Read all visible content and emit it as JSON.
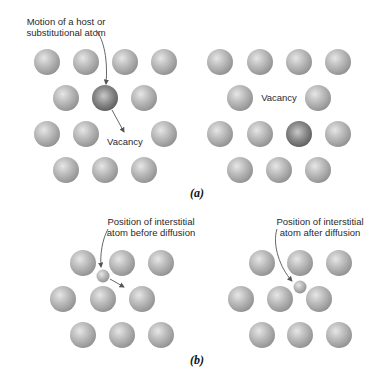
{
  "figure": {
    "panel_a": {
      "tag": "(a)",
      "left": {
        "label_line1": "Motion of a host or",
        "label_line2": "substitutional atom",
        "vacancy_label": "Vacancy"
      },
      "right": {
        "vacancy_label": "Vacancy"
      }
    },
    "panel_b": {
      "tag": "(b)",
      "left": {
        "label_line1": "Position of interstitial",
        "label_line2": "atom before diffusion"
      },
      "right": {
        "label_line1": "Position of interstitial",
        "label_line2": "atom after diffusion"
      }
    },
    "colors": {
      "host_atom": "#b9b9b9",
      "moving_atom": "#7a7a7a",
      "interstitial_atom": "#b5b5b5",
      "arrow": "#555555",
      "text": "#2a2a2a"
    }
  }
}
